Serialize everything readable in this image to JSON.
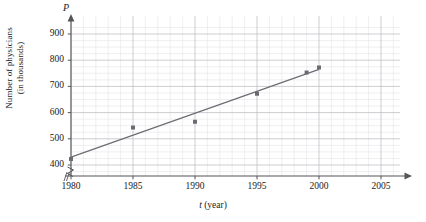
{
  "figure": {
    "y_axis_variable": "P",
    "y_axis_title_line1": "Number of physicians",
    "y_axis_title_line2": "(in thousands)",
    "x_axis_title_var": "t",
    "x_axis_title_unit": "(year)"
  },
  "chart_data": {
    "type": "scatter",
    "title": "",
    "subtitle": "",
    "xlabel": "t (year)",
    "ylabel": "Number of physicians (in thousands)",
    "x_axis_variable": "P",
    "xlim": [
      1978.5,
      2006.5
    ],
    "ylim": [
      380,
      935
    ],
    "y_axis_break": true,
    "y_axis_break_below": 400,
    "x_axis_break": true,
    "grid": true,
    "grid_minor": true,
    "grid_x_step": 1,
    "grid_y_step": 25,
    "legend": false,
    "xticks": [
      1980,
      1985,
      1990,
      1995,
      2000,
      2005
    ],
    "xtick_labels": [
      "1980",
      "1985",
      "1990",
      "1995",
      "2000",
      "2005"
    ],
    "yticks": [
      400,
      500,
      600,
      700,
      800,
      900
    ],
    "ytick_labels": [
      "400",
      "500",
      "600",
      "700",
      "800",
      "900"
    ],
    "series": [
      {
        "name": "Number of physicians",
        "type": "scatter",
        "marker": "square",
        "color": "#6b6b73",
        "x": [
          1980,
          1985,
          1990,
          1995,
          1999,
          2000
        ],
        "y": [
          423,
          543,
          565,
          672,
          753,
          772
        ]
      },
      {
        "name": "Line of best fit",
        "type": "line",
        "color": "#6b6b73",
        "x": [
          1980,
          2000
        ],
        "y": [
          430,
          765
        ]
      }
    ]
  }
}
